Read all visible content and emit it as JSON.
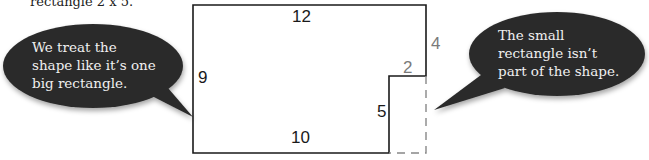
{
  "caption": "rectangle 2 x 5.",
  "bubbles": {
    "left": {
      "lines": [
        "We treat the",
        "shape like it’s one",
        "big rectangle."
      ]
    },
    "right": {
      "lines": [
        "The small",
        "rectangle isn’t",
        "part of the shape."
      ]
    }
  },
  "diagram": {
    "labels": {
      "top": "12",
      "left": "9",
      "bottom": "10",
      "notch_height": "5",
      "notch_width": "2",
      "right_upper": "4"
    },
    "colors": {
      "line": "#1a1a1a",
      "dashed": "#888888",
      "label_dark": "#1a1a1a",
      "label_gray": "#7a7a7a",
      "bubble": "#2b2b2b"
    }
  }
}
